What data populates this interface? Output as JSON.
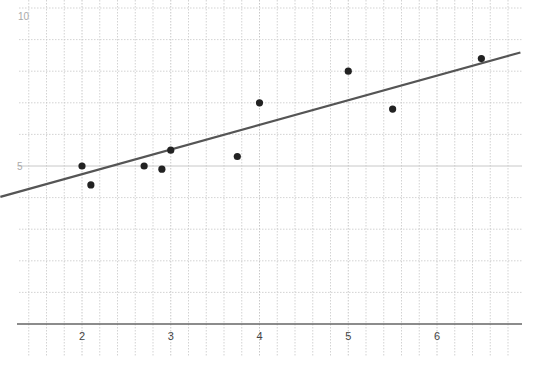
{
  "chart_data": {
    "type": "scatter",
    "title": "",
    "xlabel": "",
    "ylabel": "",
    "x_ticks": [
      2,
      3,
      4,
      5,
      6
    ],
    "y_ticks": [
      5,
      10
    ],
    "xlim": [
      1.2,
      6.95
    ],
    "ylim": [
      -1,
      10.2
    ],
    "grid": true,
    "grid_minor_x_step": 0.2,
    "grid_y_step": 1,
    "series": [
      {
        "name": "data points",
        "type": "scatter",
        "color": "#222222",
        "points": [
          {
            "x": 2.0,
            "y": 5.0
          },
          {
            "x": 2.1,
            "y": 4.4
          },
          {
            "x": 2.7,
            "y": 5.0
          },
          {
            "x": 2.9,
            "y": 4.9
          },
          {
            "x": 3.0,
            "y": 5.5
          },
          {
            "x": 3.75,
            "y": 5.3
          },
          {
            "x": 4.0,
            "y": 7.0
          },
          {
            "x": 5.0,
            "y": 8.0
          },
          {
            "x": 5.5,
            "y": 6.8
          },
          {
            "x": 6.5,
            "y": 8.4
          }
        ]
      },
      {
        "name": "line of best fit",
        "type": "line",
        "color": "#555555",
        "slope": 0.78,
        "intercept": 3.18,
        "x_range": [
          1.08,
          6.94
        ]
      }
    ]
  },
  "layout": {
    "x_origin_px": 82,
    "x_origin_value": 2,
    "px_per_x": 88.75,
    "y_axis_px": 324,
    "px_per_y": 31.6,
    "grid_left_px": 29,
    "grid_right_px": 522,
    "grid_top_px": 0,
    "grid_bottom_px": 356,
    "axis_left_px": 17,
    "axis_right_px": 522
  },
  "colors": {
    "grid": "#c8c8c8",
    "axis": "#666666",
    "label": "#444444",
    "faint_label": "#aaaaaa"
  }
}
